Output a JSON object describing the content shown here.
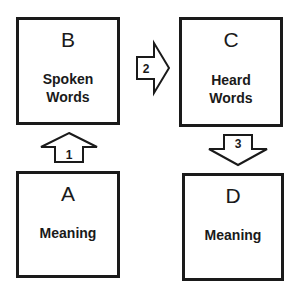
{
  "boxes": {
    "b": {
      "letter": "B",
      "label_line1": "Spoken",
      "label_line2": "Words"
    },
    "c": {
      "letter": "C",
      "label_line1": "Heard",
      "label_line2": "Words"
    },
    "a": {
      "letter": "A",
      "label_line1": "Meaning"
    },
    "d": {
      "letter": "D",
      "label_line1": "Meaning"
    }
  },
  "arrows": {
    "one": {
      "label": "1",
      "direction": "up"
    },
    "two": {
      "label": "2",
      "direction": "right"
    },
    "three": {
      "label": "3",
      "direction": "down"
    }
  }
}
